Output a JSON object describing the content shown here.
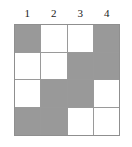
{
  "figure": {
    "type": "grid-diagram",
    "rows": 4,
    "columns": 4,
    "column_headers": [
      "1",
      "2",
      "3",
      "4"
    ],
    "colors": {
      "shaded_cell": "#999999",
      "empty_cell": "#ffffff",
      "grid_line": "#9a9a9a",
      "outer_border": "#8f8f8f",
      "header_text": "#1a1a1a",
      "background": "#ffffff"
    },
    "legend": {
      "shaded_meaning": "shaded",
      "empty_meaning": "empty"
    },
    "cells": [
      [
        {
          "state": "shaded"
        },
        {
          "state": "empty"
        },
        {
          "state": "empty"
        },
        {
          "state": "shaded"
        }
      ],
      [
        {
          "state": "empty"
        },
        {
          "state": "empty"
        },
        {
          "state": "shaded"
        },
        {
          "state": "shaded"
        }
      ],
      [
        {
          "state": "empty"
        },
        {
          "state": "shaded"
        },
        {
          "state": "shaded"
        },
        {
          "state": "empty"
        }
      ],
      [
        {
          "state": "shaded"
        },
        {
          "state": "shaded"
        },
        {
          "state": "empty"
        },
        {
          "state": "empty"
        }
      ]
    ]
  }
}
